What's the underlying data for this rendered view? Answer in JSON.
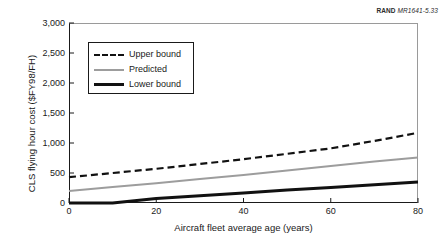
{
  "credit": {
    "org": "RAND",
    "code": "MR1641-5.33"
  },
  "chart_data": {
    "type": "line",
    "title": "",
    "xlabel": "Aircraft fleet average age (years)",
    "ylabel": "CLS flying hour cost ($FY98/FH)",
    "xlim": [
      0,
      80
    ],
    "ylim": [
      0,
      3000
    ],
    "xticks": [
      0,
      20,
      40,
      60,
      80
    ],
    "xtick_labels": [
      "0",
      "20",
      "40",
      "60",
      "80"
    ],
    "yticks": [
      0,
      500,
      1000,
      1500,
      2000,
      2500,
      3000
    ],
    "ytick_labels": [
      "0",
      "500",
      "1,000",
      "1,500",
      "2,000",
      "2,500",
      "3,000"
    ],
    "grid": false,
    "legend_position": "upper left",
    "series": [
      {
        "name": "Upper bound",
        "style": "dashed",
        "color": "#111111",
        "width": 2.2,
        "x": [
          0,
          10,
          20,
          30,
          40,
          50,
          60,
          70,
          80
        ],
        "values": [
          430,
          500,
          570,
          650,
          730,
          820,
          910,
          1035,
          1170
        ]
      },
      {
        "name": "Predicted",
        "style": "solid",
        "color": "#9d9d9d",
        "width": 2.0,
        "x": [
          0,
          10,
          20,
          30,
          40,
          50,
          60,
          70,
          80
        ],
        "values": [
          200,
          265,
          330,
          400,
          465,
          540,
          615,
          690,
          760
        ]
      },
      {
        "name": "Lower bound",
        "style": "solid",
        "color": "#111111",
        "width": 3.0,
        "x": [
          0,
          10,
          20,
          30,
          40,
          50,
          60,
          70,
          80
        ],
        "values": [
          0,
          0,
          75,
          120,
          165,
          215,
          260,
          305,
          350
        ]
      }
    ]
  },
  "legend": {
    "items": [
      {
        "label": "Upper bound",
        "key": "dashed-line-key"
      },
      {
        "label": "Predicted",
        "key": "gray-line-key"
      },
      {
        "label": "Lower bound",
        "key": "solid-line-key"
      }
    ]
  }
}
